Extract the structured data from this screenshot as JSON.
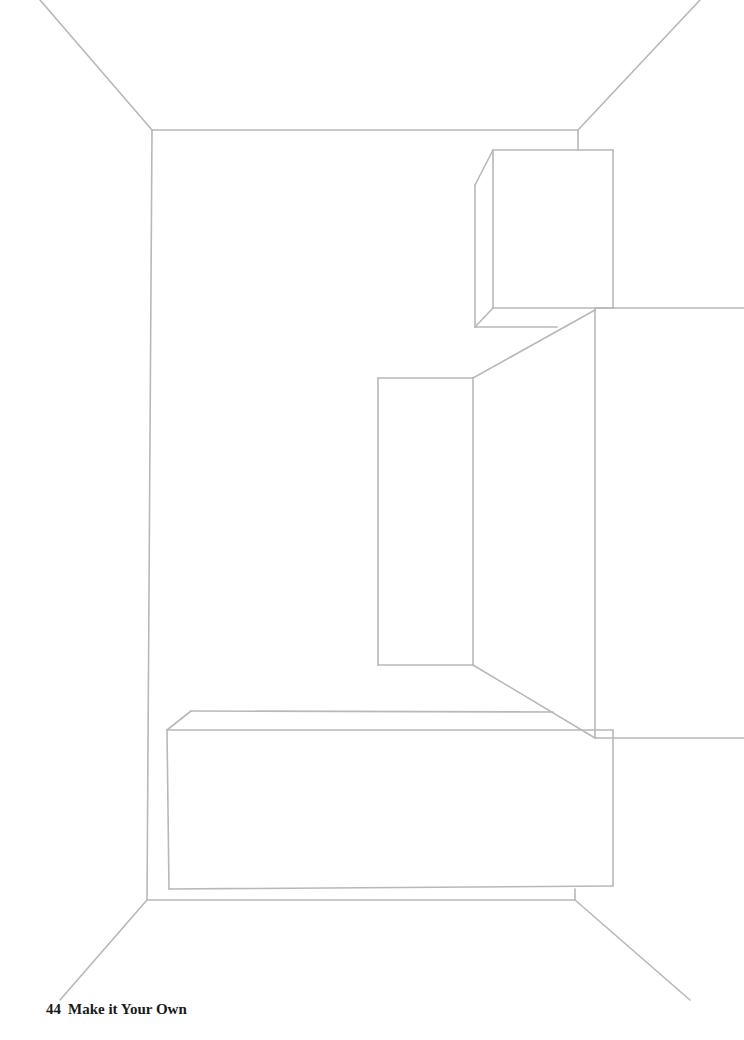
{
  "page": {
    "number": "44",
    "title": "Make it Your Own"
  },
  "colors": {
    "line": "#b8b8b8",
    "background": "#ffffff",
    "text": "#1a1a1a"
  },
  "drawing": {
    "lines": [
      [
        40,
        0,
        152,
        130
      ],
      [
        700,
        0,
        578,
        130
      ],
      [
        152,
        130,
        578,
        130
      ],
      [
        152,
        130,
        147,
        900
      ],
      [
        578,
        130,
        578,
        150
      ],
      [
        147,
        900,
        60,
        1000
      ],
      [
        575,
        900,
        690,
        1000
      ],
      [
        147,
        900,
        575,
        900
      ],
      [
        575,
        889,
        575,
        900
      ],
      [
        493,
        150,
        613,
        150
      ],
      [
        613,
        150,
        613,
        308
      ],
      [
        493,
        150,
        493,
        308
      ],
      [
        493,
        308,
        613,
        308
      ],
      [
        493,
        150,
        475,
        185
      ],
      [
        475,
        185,
        475,
        327
      ],
      [
        475,
        327,
        493,
        308
      ],
      [
        475,
        327,
        557,
        327
      ],
      [
        595,
        308,
        744,
        308
      ],
      [
        595,
        308,
        595,
        738
      ],
      [
        595,
        738,
        744,
        738
      ],
      [
        473,
        378,
        595,
        310
      ],
      [
        473,
        665,
        595,
        738
      ],
      [
        473,
        378,
        473,
        665
      ],
      [
        378,
        378,
        473,
        378
      ],
      [
        378,
        378,
        378,
        665
      ],
      [
        378,
        665,
        473,
        665
      ],
      [
        167,
        730,
        613,
        730
      ],
      [
        167,
        730,
        169,
        889
      ],
      [
        169,
        889,
        613,
        886
      ],
      [
        613,
        730,
        613,
        886
      ],
      [
        167,
        730,
        191,
        711
      ],
      [
        191,
        711,
        553,
        712
      ]
    ]
  }
}
